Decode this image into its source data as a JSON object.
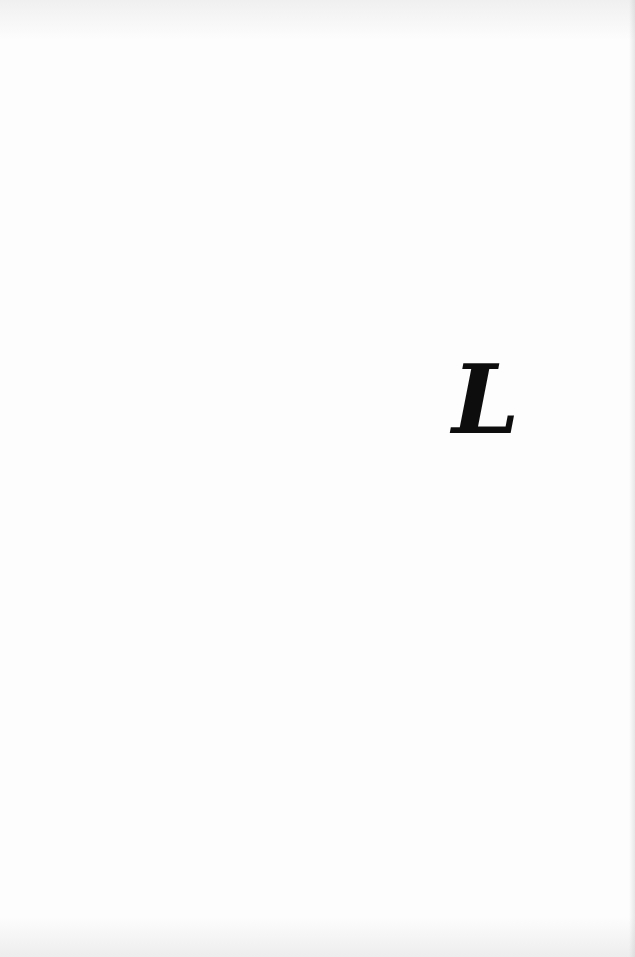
{
  "page": {
    "type": "scanned-book-page",
    "glyph": "L",
    "glyph_style": "large italic bold serif letter",
    "text_color": "#0d0d0d",
    "background_color": "#fdfdfd"
  }
}
